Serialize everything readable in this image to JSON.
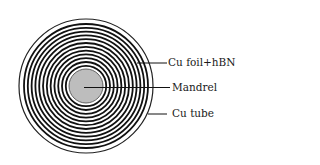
{
  "diagram": {
    "type": "cross-section",
    "labels": [
      {
        "id": "cu-foil-hbn",
        "text": "Cu foil+hBN"
      },
      {
        "id": "mandrel",
        "text": "Mandrel"
      },
      {
        "id": "cu-tube",
        "text": "Cu tube"
      }
    ],
    "colors": {
      "ring": "#111111",
      "mandrel": "#bdbdbd",
      "background": "#ffffff"
    },
    "ring_count": 11
  }
}
